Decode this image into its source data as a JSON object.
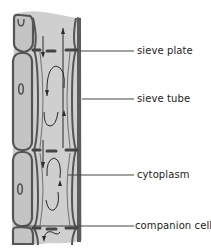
{
  "diagram": {
    "colors": {
      "cell_fill": "#c8c8c8",
      "cell_fill_light": "#d4d4d4",
      "wall_stroke": "#5a5a5a",
      "wall_dark": "#3c3c3c",
      "arrow": "#2a2a2a",
      "leader_line": "#444444",
      "label_text": "#222222",
      "background": "#ffffff"
    },
    "labels": [
      {
        "id": "sieve-plate",
        "text": "sieve plate",
        "x": 137,
        "y": 45,
        "line": {
          "x1": 80,
          "y1": 51,
          "x2": 134,
          "y2": 51
        }
      },
      {
        "id": "sieve-tube",
        "text": "sieve tube",
        "x": 137,
        "y": 93,
        "line": {
          "x1": 82,
          "y1": 99,
          "x2": 134,
          "y2": 99
        }
      },
      {
        "id": "cytoplasm",
        "text": "cytoplasm",
        "x": 137,
        "y": 169,
        "line": {
          "x1": 68,
          "y1": 175,
          "x2": 134,
          "y2": 175
        }
      },
      {
        "id": "companion-cell",
        "text": "companion cell",
        "x": 135,
        "y": 220,
        "line": {
          "x1": 22,
          "y1": 226,
          "x2": 134,
          "y2": 226
        }
      }
    ]
  }
}
